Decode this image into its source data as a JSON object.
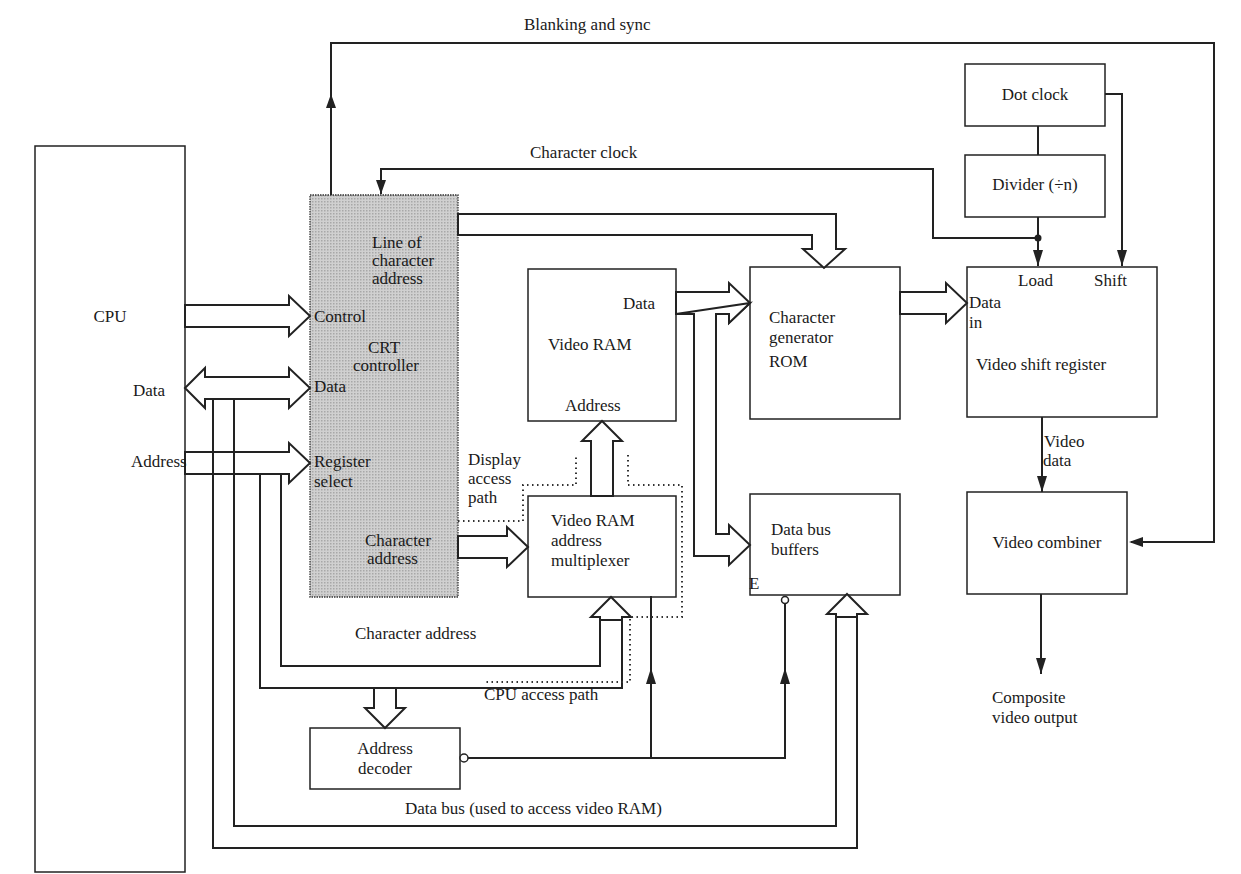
{
  "blocks": {
    "cpu": "CPU",
    "crt": {
      "title1": "CRT",
      "title2": "controller",
      "line_of_char_1": "Line of",
      "line_of_char_2": "character",
      "line_of_char_3": "address",
      "control": "Control",
      "data": "Data",
      "reg_sel_1": "Register",
      "reg_sel_2": "select",
      "char_addr_1": "Character",
      "char_addr_2": "address"
    },
    "video_ram": {
      "title": "Video RAM",
      "data": "Data",
      "address": "Address"
    },
    "mux": {
      "l1": "Video RAM",
      "l2": "address",
      "l3": "multiplexer"
    },
    "char_rom": {
      "l1": "Character",
      "l2": "generator",
      "l3": "ROM"
    },
    "dbb": {
      "l1": "Data bus",
      "l2": "buffers",
      "enable": "E"
    },
    "dot_clock": "Dot clock",
    "divider": "Divider (÷n)",
    "vsr": {
      "load": "Load",
      "shift": "Shift",
      "data_in_1": "Data",
      "data_in_2": "in",
      "title": "Video shift register"
    },
    "combiner": "Video combiner",
    "addr_decoder": {
      "l1": "Address",
      "l2": "decoder"
    }
  },
  "signals": {
    "blanking": "Blanking and sync",
    "char_clock": "Character clock",
    "cpu_data": "Data",
    "cpu_address": "Address",
    "display_path_1": "Display",
    "display_path_2": "access",
    "display_path_3": "path",
    "char_address": "Character address",
    "cpu_path": "CPU access path",
    "data_bus": "Data bus (used to access video RAM)",
    "video_data_1": "Video",
    "video_data_2": "data",
    "composite_1": "Composite",
    "composite_2": "video output"
  }
}
